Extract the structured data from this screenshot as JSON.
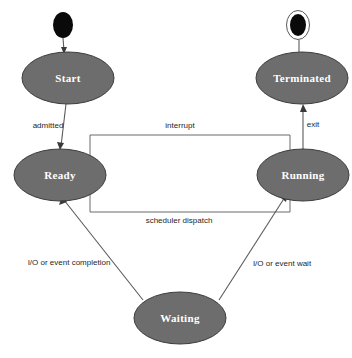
{
  "diagram": {
    "background_color": "#ffffff",
    "node_fill_color": "#6d6d6d",
    "node_text_color": "#ffffff",
    "edge_color": "#5a5a5a",
    "states": [
      {
        "id": "start",
        "label": "Start",
        "cx": 68,
        "cy": 78,
        "rx": 46,
        "ry": 26
      },
      {
        "id": "terminated",
        "label": "Terminated",
        "cx": 302,
        "cy": 78,
        "rx": 46,
        "ry": 26
      },
      {
        "id": "ready",
        "label": "Ready",
        "cx": 60,
        "cy": 175,
        "rx": 46,
        "ry": 26
      },
      {
        "id": "running",
        "label": "Running",
        "cx": 303,
        "cy": 175,
        "rx": 46,
        "ry": 26
      },
      {
        "id": "waiting",
        "label": "Waiting",
        "cx": 180,
        "cy": 318,
        "rx": 46,
        "ry": 26
      }
    ],
    "pseudostates": [
      {
        "id": "initial-node",
        "kind": "initial",
        "cx": 63,
        "cy": 25,
        "rx": 10,
        "ry": 13
      },
      {
        "id": "final-node",
        "kind": "final",
        "cx": 298,
        "cy": 25,
        "rx": 10,
        "ry": 13
      }
    ],
    "transitions": [
      {
        "id": "initial-to-start",
        "label": "",
        "from": "initial-node",
        "to": "start"
      },
      {
        "id": "start-to-ready",
        "label": "admitted",
        "from": "start",
        "to": "ready",
        "label_x": 48,
        "label_y": 126
      },
      {
        "id": "ready-to-running",
        "label": "scheduler dispatch",
        "from": "ready",
        "to": "running",
        "label_x": 179,
        "label_y": 221
      },
      {
        "id": "running-to-ready",
        "label": "interrupt",
        "from": "running",
        "to": "ready",
        "label_x": 180,
        "label_y": 126
      },
      {
        "id": "running-to-terminated",
        "label": "exit",
        "from": "running",
        "to": "terminated",
        "label_x": 313,
        "label_y": 125
      },
      {
        "id": "running-to-waiting",
        "label": "I/O or event wait",
        "from": "running",
        "to": "waiting",
        "label_x": 282,
        "label_y": 264
      },
      {
        "id": "waiting-to-ready",
        "label": "I/O or event completion",
        "from": "waiting",
        "to": "ready",
        "label_x": 69,
        "label_y": 263
      }
    ]
  }
}
